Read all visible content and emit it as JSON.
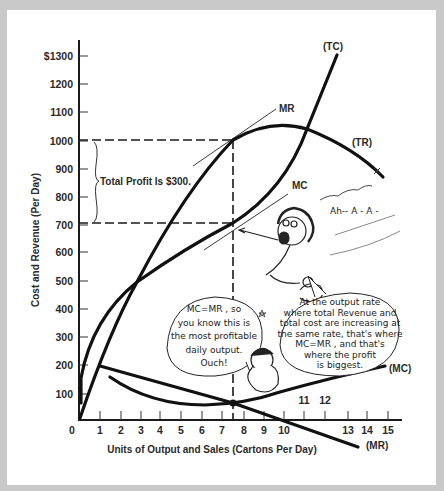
{
  "chart_data": {
    "type": "line",
    "title": "",
    "xlabel": "Units of Output and Sales (Cartons Per Day)",
    "ylabel": "Cost and Revenue (Per Day)",
    "xlim": [
      0,
      15
    ],
    "ylim": [
      0,
      1300
    ],
    "grid": false,
    "x_ticks": [
      "0",
      "1",
      "2",
      "3",
      "4",
      "5",
      "6",
      "7",
      "8",
      "9",
      "10",
      "11",
      "12",
      "13",
      "14",
      "15"
    ],
    "y_ticks": [
      "100",
      "200",
      "300",
      "400",
      "500",
      "600",
      "700",
      "800",
      "900",
      "1000",
      "1100",
      "1200",
      "$1300"
    ],
    "series": [
      {
        "name": "(TC)",
        "x": [
          0,
          1,
          3,
          5,
          7.5,
          10,
          12.5
        ],
        "y": [
          150,
          340,
          500,
          600,
          700,
          1050,
          1300
        ]
      },
      {
        "name": "(TR)",
        "x": [
          0,
          1,
          3,
          5,
          7.5,
          10,
          12,
          14.5
        ],
        "y": [
          0,
          210,
          500,
          800,
          1000,
          1040,
          1000,
          850
        ]
      },
      {
        "name": "(MC)",
        "x": [
          1.5,
          3,
          5,
          7.5,
          10,
          12,
          15
        ],
        "y": [
          160,
          90,
          60,
          65,
          100,
          140,
          190
        ]
      },
      {
        "name": "(MR)",
        "x": [
          1,
          3,
          5,
          7.5,
          10,
          13,
          14.5
        ],
        "y": [
          210,
          160,
          120,
          65,
          10,
          -50,
          -80
        ]
      }
    ],
    "annotations": [
      {
        "text": "Total Profit Is $300.",
        "range_y": [
          700,
          1000
        ]
      },
      {
        "text": "MR",
        "points_to": "tangent of TR at x=7.5"
      },
      {
        "text": "MC",
        "points_to": "tangent of TC at x=7.5"
      },
      {
        "text": "MC=MR, so you know this is the most profitable daily output. Ouch!"
      },
      {
        "text": "At the output rate where total Revenue and total cost are increasing at the same rate, that's where MC=MR, and that's where the profit is biggest."
      },
      {
        "text": "Ah--A-A-"
      }
    ],
    "reference_lines": {
      "x": 7.5,
      "y": [
        700,
        1000
      ]
    }
  },
  "labels": {
    "ylabel": "Cost and Revenue (Per Day)",
    "xlabel": "Units of Output and Sales (Cartons Per Day)",
    "tc": "(TC)",
    "tr": "(TR)",
    "mc": "(MC)",
    "mr": "(MR)",
    "mr_tangent": "MR",
    "mc_tangent": "MC",
    "profit": "Total Profit Is $300.",
    "scream": "Ah-- A - A -",
    "bubble1": [
      "MC=MR , so",
      "you know this is",
      "the most profitable",
      "daily output.",
      "Ouch!"
    ],
    "bubble2": [
      "At the output rate",
      "where total Revenue and",
      "total cost are increasing at",
      "the same rate, that's where",
      "MC=MR , and that's",
      "where the profit",
      "is biggest."
    ]
  },
  "yticks": [
    {
      "label": "$1300",
      "y": 56
    },
    {
      "label": "1200",
      "y": 84
    },
    {
      "label": "1100",
      "y": 112
    },
    {
      "label": "1000",
      "y": 141
    },
    {
      "label": "900",
      "y": 169
    },
    {
      "label": "800",
      "y": 197
    },
    {
      "label": "700",
      "y": 225
    },
    {
      "label": "600",
      "y": 252
    },
    {
      "label": "500",
      "y": 281
    },
    {
      "label": "400",
      "y": 309
    },
    {
      "label": "300",
      "y": 337
    },
    {
      "label": "200",
      "y": 365
    },
    {
      "label": "100",
      "y": 394
    }
  ],
  "xticks": [
    {
      "label": "0",
      "x": 72,
      "y": 434
    },
    {
      "label": "1",
      "x": 100,
      "y": 434
    },
    {
      "label": "2",
      "x": 121,
      "y": 434
    },
    {
      "label": "3",
      "x": 141,
      "y": 434
    },
    {
      "label": "4",
      "x": 160,
      "y": 434
    },
    {
      "label": "5",
      "x": 181,
      "y": 434
    },
    {
      "label": "6",
      "x": 202,
      "y": 434
    },
    {
      "label": "7",
      "x": 222,
      "y": 434
    },
    {
      "label": "8",
      "x": 244,
      "y": 434
    },
    {
      "label": "9",
      "x": 264,
      "y": 434
    },
    {
      "label": "10",
      "x": 284,
      "y": 434
    },
    {
      "label": "11",
      "x": 304,
      "y": 404
    },
    {
      "label": "12",
      "x": 325,
      "y": 404
    },
    {
      "label": "13",
      "x": 348,
      "y": 434
    },
    {
      "label": "14",
      "x": 367,
      "y": 434
    },
    {
      "label": "15",
      "x": 388,
      "y": 434
    }
  ]
}
